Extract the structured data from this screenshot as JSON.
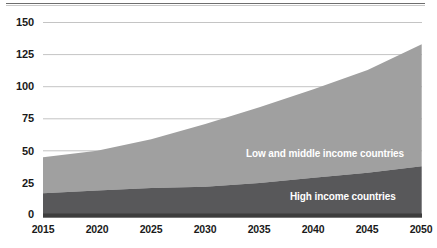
{
  "chart_data": {
    "type": "area",
    "stacked": true,
    "title": "",
    "subtitle": "",
    "xlabel": "",
    "ylabel": "",
    "grid": true,
    "legend_position": "in-plot",
    "x": [
      2015,
      2020,
      2025,
      2030,
      2035,
      2040,
      2045,
      2050
    ],
    "xtick_labels": [
      "2015",
      "2020",
      "2025",
      "2030",
      "2035",
      "2040",
      "2045",
      "2050"
    ],
    "xlim": [
      2015,
      2050
    ],
    "ytick_labels": [
      "0",
      "25",
      "50",
      "75",
      "100",
      "125",
      "150"
    ],
    "yticks": [
      0,
      25,
      50,
      75,
      100,
      125,
      150
    ],
    "ylim": [
      0,
      150
    ],
    "series": [
      {
        "name": "High income countries",
        "color": "#58585a",
        "label_color": "#ffffff",
        "values": [
          17,
          19,
          21,
          22,
          25,
          29,
          33,
          38
        ]
      },
      {
        "name": "Low and middle income countries",
        "color": "#a0a0a0",
        "label_color": "#ffffff",
        "values": [
          28,
          31,
          38,
          49,
          59,
          69,
          80,
          95
        ]
      }
    ],
    "totals": [
      45,
      50,
      59,
      71,
      84,
      98,
      113,
      133
    ],
    "annotations": [
      {
        "text": "Low and middle income countries",
        "series": "Low and middle income countries"
      },
      {
        "text": "High income countries",
        "series": "High income countries"
      }
    ]
  },
  "axis": {
    "y_labels": [
      "150",
      "125",
      "100",
      "75",
      "50",
      "25",
      "0"
    ],
    "x_labels": [
      "2015",
      "2020",
      "2025",
      "2030",
      "2035",
      "2040",
      "2045",
      "2050"
    ]
  },
  "colors": {
    "high_income": "#58585a",
    "low_middle_income": "#a0a0a0",
    "gridline": "#c4c4c4",
    "axis": "#3d3d3d",
    "tick_text": "#1a1a1a",
    "label_text": "#ffffff",
    "background": "#ffffff"
  }
}
